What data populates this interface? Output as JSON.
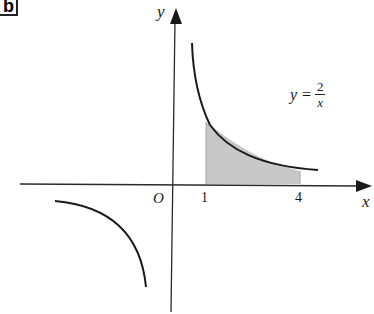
{
  "figure": {
    "label": "b",
    "axis_x_label": "x",
    "axis_y_label": "y",
    "origin_label": "O",
    "tick_labels": [
      "1",
      "4"
    ],
    "equation": {
      "lhs": "y",
      "equals": "=",
      "numerator": "2",
      "denominator": "x"
    },
    "shaded_region": {
      "from_x": 1,
      "to_x": 4,
      "color": "#c8c8c8"
    },
    "curve_color": "#1a1a1a",
    "axis_color": "#2a2a2a"
  }
}
